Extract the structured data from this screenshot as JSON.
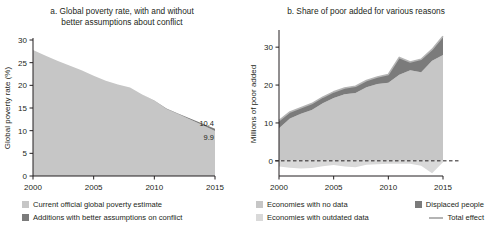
{
  "figure": {
    "width": 488,
    "height": 239,
    "background": "#ffffff"
  },
  "colors": {
    "light_gray": "#c6c6c6",
    "dark_gray": "#7b7b7b",
    "pale_gray": "#d9d9d9",
    "line_gray": "#b4b4b4",
    "axis": "#231f20",
    "text": "#231f20"
  },
  "panel_a": {
    "title": "a. Global poverty rate, with and without better assumptions about conflict",
    "title_line1": "a. Global poverty rate, with and without",
    "title_line2": "better assumptions about conflict",
    "legend": [
      {
        "label": "Current official global poverty estimate",
        "swatch": "#c6c6c6",
        "type": "area"
      },
      {
        "label": "Additions with better assumptions on conflict",
        "swatch": "#7b7b7b",
        "type": "area"
      }
    ]
  },
  "panel_b": {
    "title": "b. Share of poor added for various reasons",
    "legend": [
      {
        "label": "Economies with no data",
        "swatch": "#c6c6c6",
        "type": "area"
      },
      {
        "label": "Displaced people",
        "swatch": "#7b7b7b",
        "type": "area"
      },
      {
        "label": "Economies with outdated data",
        "swatch": "#d9d9d9",
        "type": "area"
      },
      {
        "label": "Total effect",
        "swatch": "#b4b4b4",
        "type": "line"
      }
    ]
  },
  "chart_data": [
    {
      "id": "panel-a",
      "type": "area",
      "title": "a. Global poverty rate, with and without better assumptions about conflict",
      "xlabel": "",
      "ylabel": "Global poverty rate (%)",
      "xlim": [
        2000,
        2015
      ],
      "ylim": [
        0,
        30
      ],
      "xticks": [
        2000,
        2005,
        2010,
        2015
      ],
      "yticks": [
        0,
        5,
        10,
        15,
        20,
        25,
        30
      ],
      "grid": false,
      "legend_position": "bottom",
      "x": [
        2000,
        2001,
        2002,
        2003,
        2004,
        2005,
        2006,
        2007,
        2008,
        2009,
        2010,
        2011,
        2012,
        2013,
        2014,
        2015
      ],
      "series": [
        {
          "name": "Current official global poverty estimate",
          "color": "#c6c6c6",
          "values": [
            27.8,
            26.6,
            25.4,
            24.4,
            23.3,
            22.1,
            21.0,
            20.2,
            19.5,
            18.0,
            16.6,
            14.8,
            13.6,
            12.4,
            11.2,
            9.9
          ]
        },
        {
          "name": "Additions with better assumptions on conflict",
          "color": "#7b7b7b",
          "values": [
            0.0,
            0.0,
            0.0,
            0.0,
            0.0,
            0.0,
            0.0,
            0.0,
            0.0,
            0.0,
            0.05,
            0.1,
            0.15,
            0.25,
            0.35,
            0.5
          ]
        }
      ],
      "annotations": [
        {
          "text": "10.4",
          "x": 2015,
          "y": 10.4,
          "note": "total with conflict additions"
        },
        {
          "text": "9.9",
          "x": 2015,
          "y": 9.9,
          "note": "current official estimate"
        }
      ]
    },
    {
      "id": "panel-b",
      "type": "area",
      "title": "b. Share of poor added for various reasons",
      "xlabel": "",
      "ylabel": "Millions of poor added",
      "xlim": [
        2000,
        2015
      ],
      "ylim": [
        -4,
        34
      ],
      "xticks": [
        2000,
        2005,
        2010,
        2015
      ],
      "yticks": [
        0,
        10,
        20,
        30
      ],
      "grid": false,
      "zero_line": true,
      "legend_position": "bottom",
      "x": [
        2000,
        2001,
        2002,
        2003,
        2004,
        2005,
        2006,
        2007,
        2008,
        2009,
        2010,
        2011,
        2012,
        2013,
        2014,
        2015
      ],
      "series": [
        {
          "name": "Economies with no data",
          "color": "#c6c6c6",
          "values": [
            8.6,
            11.2,
            12.4,
            13.4,
            15.2,
            16.6,
            17.6,
            17.9,
            19.4,
            20.3,
            20.6,
            22.7,
            23.9,
            23.4,
            26.4,
            27.9
          ]
        },
        {
          "name": "Displaced people",
          "color": "#7b7b7b",
          "values": [
            2.0,
            1.7,
            1.6,
            1.7,
            1.6,
            1.6,
            1.6,
            1.8,
            1.8,
            1.8,
            2.2,
            4.6,
            2.2,
            3.4,
            3.0,
            5.0
          ]
        },
        {
          "name": "Economies with outdated data",
          "color": "#d9d9d9",
          "values": [
            -1.5,
            -1.8,
            -2.0,
            -1.9,
            -1.4,
            -1.1,
            -1.5,
            -1.7,
            -1.0,
            -0.9,
            -0.8,
            -0.8,
            -0.8,
            -1.3,
            -3.3,
            -0.4
          ]
        }
      ],
      "total_line": {
        "name": "Total effect",
        "color": "#b4b4b4",
        "values": [
          10.6,
          12.9,
          14.0,
          15.1,
          16.8,
          18.2,
          19.2,
          19.7,
          21.2,
          22.1,
          22.8,
          27.3,
          26.1,
          26.8,
          29.4,
          32.9
        ]
      }
    }
  ]
}
